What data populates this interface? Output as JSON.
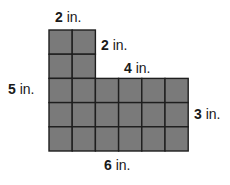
{
  "figure": {
    "shape": "L-shaped composite rectangle on a unit grid",
    "fill_color": "#7a7a7a",
    "line_color": "#1e1e1e",
    "labels": {
      "top_width": {
        "value": "2",
        "unit": "in."
      },
      "top_right_height": {
        "value": "2",
        "unit": "in."
      },
      "step_width": {
        "value": "4",
        "unit": "in."
      },
      "left_height": {
        "value": "5",
        "unit": "in."
      },
      "right_height": {
        "value": "3",
        "unit": "in."
      },
      "bottom_width": {
        "value": "6",
        "unit": "in."
      }
    },
    "grid": {
      "columns": 6,
      "rows": 5,
      "cells": [
        [
          1,
          1,
          0,
          0,
          0,
          0
        ],
        [
          1,
          1,
          0,
          0,
          0,
          0
        ],
        [
          1,
          1,
          1,
          1,
          1,
          1
        ],
        [
          1,
          1,
          1,
          1,
          1,
          1
        ],
        [
          1,
          1,
          1,
          1,
          1,
          1
        ]
      ]
    }
  }
}
